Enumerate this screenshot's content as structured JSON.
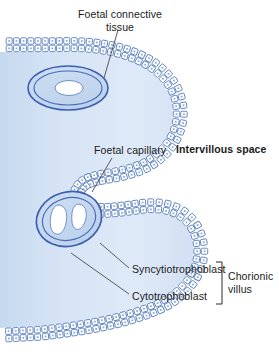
{
  "figure": {
    "background_color": "#ffffff"
  },
  "labels": {
    "foetal_connective_tissue": "Foetal connective\ntissue",
    "foetal_capillary": "Foetal capillary",
    "intervillous_space": "Intervillous space",
    "syncytiotrophoblast": "Syncytiotrophoblast",
    "cytotrophoblast": "Cytotrophoblast",
    "chorionic_villus": "Chorionic\nvillus"
  },
  "structures": {
    "stroma_name": "foetal-connective-tissue-stroma",
    "outer_cell_layer_name": "syncytiotrophoblast-layer",
    "inner_cell_layer_name": "cytotrophoblast-layer",
    "capillary_upper_name": "foetal-capillary-upper",
    "capillary_lower_name": "foetal-capillary-lower",
    "intervillous_space_name": "intervillous-space-region"
  },
  "colors": {
    "stroma_fill": "#cfdff2",
    "stroma_fill_light": "#e2edf9",
    "cell_fill": "#ffffff",
    "cell_stroke": "#5a7fc0",
    "capillary_stroke": "#3a5fae",
    "capillary_fill": "#c3d6ef",
    "lumen_fill": "#ffffff",
    "leader_line": "#4a4a4a",
    "bracket": "#2b2b2b",
    "text": "#1a1a1a"
  },
  "leader_lines": [
    {
      "name": "leader-foetal-connective-tissue",
      "x1": 118,
      "y1": 30,
      "x2": 104,
      "y2": 78
    },
    {
      "name": "leader-foetal-capillary",
      "x1": 112,
      "y1": 158,
      "x2": 92,
      "y2": 192
    },
    {
      "name": "leader-syncytiotrophoblast",
      "x1": 129,
      "y1": 268,
      "x2": 100,
      "y2": 243
    },
    {
      "name": "leader-cytotrophoblast",
      "x1": 129,
      "y1": 294,
      "x2": 71,
      "y2": 253
    }
  ],
  "bracket": {
    "name": "chorionic-villus-bracket",
    "x": 222,
    "y_top": 262,
    "y_bottom": 304,
    "cap_width": 6
  }
}
